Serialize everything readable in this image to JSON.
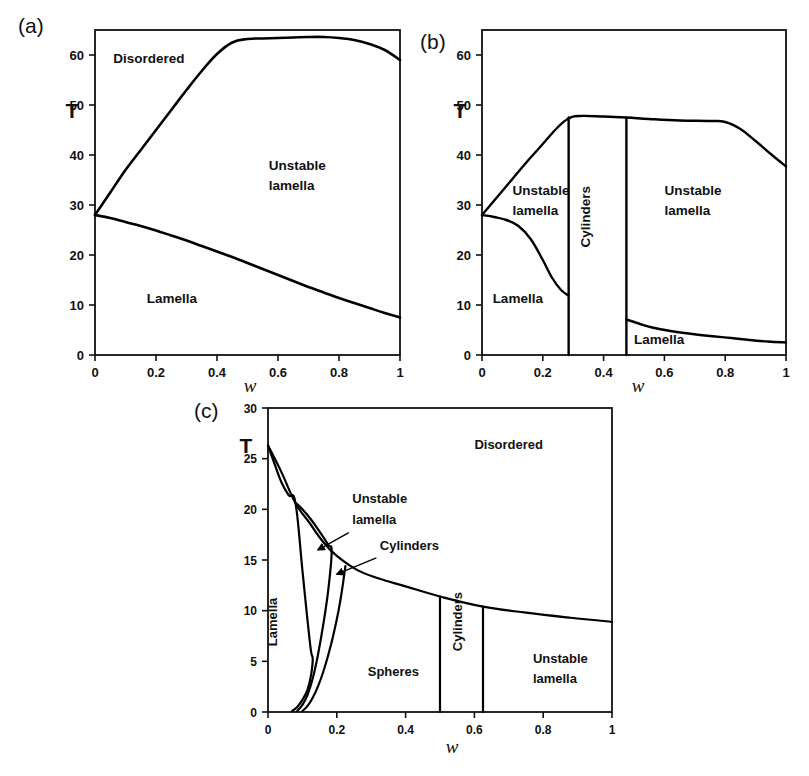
{
  "figure": {
    "panels": [
      {
        "tag": "(a)",
        "axis": {
          "xlabel": "w",
          "ylabel": "T",
          "xticks": [
            "0",
            "0.2",
            "0.4",
            "0.6",
            "0.8",
            "1"
          ],
          "xtick_values": [
            0,
            0.2,
            0.4,
            0.6,
            0.8,
            1
          ],
          "yticks": [
            "0",
            "10",
            "20",
            "30",
            "40",
            "50",
            "60"
          ],
          "ytick_values": [
            0,
            10,
            20,
            30,
            40,
            50,
            60
          ],
          "xlim": [
            0,
            1
          ],
          "ylim": [
            0,
            65
          ]
        },
        "regions": [
          {
            "label": "Disordered",
            "x": 0.06,
            "y": 58.5
          },
          {
            "label": "Unstable",
            "x": 0.57,
            "y": 37.0
          },
          {
            "label": "lamella",
            "x": 0.57,
            "y": 33.0
          },
          {
            "label": "Lamella",
            "x": 0.17,
            "y": 10.5
          }
        ]
      },
      {
        "tag": "(b)",
        "axis": {
          "xlabel": "w",
          "ylabel": "T",
          "xticks": [
            "0",
            "0.2",
            "0.4",
            "0.6",
            "0.8",
            "1"
          ],
          "xtick_values": [
            0,
            0.2,
            0.4,
            0.6,
            0.8,
            1
          ],
          "yticks": [
            "0",
            "10",
            "20",
            "30",
            "40",
            "50",
            "60"
          ],
          "ytick_values": [
            0,
            10,
            20,
            30,
            40,
            50,
            60
          ],
          "xlim": [
            0,
            1
          ],
          "ylim": [
            0,
            65
          ]
        },
        "regions": [
          {
            "label": "Unstable",
            "x": 0.1,
            "y": 32.0
          },
          {
            "label": "lamella",
            "x": 0.1,
            "y": 28.0
          },
          {
            "label": "Cylinders",
            "x": 0.355,
            "y": 21.5,
            "rotate": -90
          },
          {
            "label": "Unstable",
            "x": 0.6,
            "y": 32.0
          },
          {
            "label": "lamella",
            "x": 0.6,
            "y": 28.0
          },
          {
            "label": "Lamella",
            "x": 0.5,
            "y": 2.2
          },
          {
            "label": "Lamella",
            "x": 0.035,
            "y": 10.5
          }
        ]
      },
      {
        "tag": "(c)",
        "axis": {
          "xlabel": "w",
          "ylabel": "T",
          "xticks": [
            "0",
            "0.2",
            "0.4",
            "0.6",
            "0.8",
            "1"
          ],
          "xtick_values": [
            0,
            0.2,
            0.4,
            0.6,
            0.8,
            1
          ],
          "yticks": [
            "0",
            "5",
            "10",
            "15",
            "20",
            "25",
            "30"
          ],
          "ytick_values": [
            0,
            5,
            10,
            15,
            20,
            25,
            30
          ],
          "xlim": [
            0,
            1
          ],
          "ylim": [
            0,
            30
          ]
        },
        "regions": [
          {
            "label": "Disordered",
            "x": 0.6,
            "y": 26.0
          },
          {
            "label": "Unstable",
            "x": 0.245,
            "y": 20.6
          },
          {
            "label": "lamella",
            "x": 0.245,
            "y": 18.6
          },
          {
            "label": "Cylinders",
            "x": 0.325,
            "y": 16.0
          },
          {
            "label": "Lamella",
            "x": 0.025,
            "y": 6.5,
            "rotate": -90
          },
          {
            "label": "Spheres",
            "x": 0.29,
            "y": 3.6
          },
          {
            "label": "Cylinders",
            "x": 0.565,
            "y": 6.0,
            "rotate": -90
          },
          {
            "label": "Unstable",
            "x": 0.77,
            "y": 4.8
          },
          {
            "label": "lamella",
            "x": 0.77,
            "y": 2.9
          }
        ]
      }
    ]
  },
  "chart_data": [
    {
      "type": "line",
      "panel": "(a)",
      "title": "",
      "xlabel": "w",
      "ylabel": "T",
      "xlim": [
        0,
        1
      ],
      "ylim": [
        0,
        65
      ],
      "grid": false,
      "legend": "none",
      "annotations": [
        "Disordered",
        "Unstable lamella",
        "Lamella"
      ],
      "series": [
        {
          "name": "Order-disorder transition (upper boundary)",
          "x": [
            0,
            0.05,
            0.1,
            0.15,
            0.2,
            0.25,
            0.3,
            0.35,
            0.4,
            0.45,
            0.5,
            0.55,
            0.6,
            0.65,
            0.7,
            0.75,
            0.8,
            0.85,
            0.9,
            0.95,
            1.0
          ],
          "y": [
            28.0,
            32.5,
            37.0,
            41.0,
            45.0,
            49.0,
            53.0,
            56.8,
            60.2,
            62.5,
            63.2,
            63.3,
            63.4,
            63.5,
            63.6,
            63.6,
            63.4,
            63.0,
            62.2,
            61.0,
            59.0
          ]
        },
        {
          "name": "Lamella stability limit (lower boundary)",
          "x": [
            0,
            0.05,
            0.1,
            0.15,
            0.2,
            0.25,
            0.3,
            0.35,
            0.4,
            0.45,
            0.5,
            0.55,
            0.6,
            0.65,
            0.7,
            0.75,
            0.8,
            0.85,
            0.9,
            0.95,
            1.0
          ],
          "y": [
            28.0,
            27.4,
            26.6,
            25.8,
            24.9,
            23.9,
            22.9,
            21.8,
            20.7,
            19.6,
            18.4,
            17.2,
            16.0,
            14.8,
            13.6,
            12.5,
            11.4,
            10.4,
            9.4,
            8.4,
            7.5
          ]
        }
      ]
    },
    {
      "type": "line",
      "panel": "(b)",
      "title": "",
      "xlabel": "w",
      "ylabel": "T",
      "xlim": [
        0,
        1
      ],
      "ylim": [
        0,
        65
      ],
      "grid": false,
      "legend": "none",
      "annotations": [
        "Unstable lamella",
        "Cylinders",
        "Unstable lamella",
        "Lamella",
        "Lamella"
      ],
      "series": [
        {
          "name": "Order-disorder transition (upper boundary)",
          "x": [
            0,
            0.05,
            0.1,
            0.15,
            0.2,
            0.25,
            0.285,
            0.32,
            0.4,
            0.475,
            0.55,
            0.65,
            0.75,
            0.8,
            0.85,
            0.9,
            0.95,
            1.0
          ],
          "y": [
            28.0,
            31.6,
            35.2,
            38.8,
            42.2,
            45.6,
            47.3,
            47.8,
            47.7,
            47.5,
            47.2,
            46.9,
            46.8,
            46.6,
            45.2,
            42.8,
            40.2,
            37.7
          ]
        },
        {
          "name": "Left lamella stability limit",
          "x": [
            0,
            0.04,
            0.08,
            0.12,
            0.16,
            0.2,
            0.23,
            0.26,
            0.285
          ],
          "y": [
            28.0,
            27.6,
            27.0,
            25.8,
            23.2,
            19.0,
            15.5,
            13.0,
            11.9
          ]
        },
        {
          "name": "Right lamella stability limit",
          "x": [
            0.475,
            0.52,
            0.56,
            0.62,
            0.68,
            0.75,
            0.82,
            0.88,
            0.94,
            1.0
          ],
          "y": [
            7.1,
            6.2,
            5.5,
            4.8,
            4.3,
            3.8,
            3.4,
            3.0,
            2.7,
            2.5
          ]
        },
        {
          "name": "Lamella/Cylinders vertical boundary",
          "x": [
            0.285,
            0.285
          ],
          "y": [
            0,
            47.5
          ]
        },
        {
          "name": "Cylinders/Unstable-lamella vertical boundary",
          "x": [
            0.475,
            0.475
          ],
          "y": [
            0,
            47.4
          ]
        }
      ]
    },
    {
      "type": "line",
      "panel": "(c)",
      "title": "",
      "xlabel": "w",
      "ylabel": "T",
      "xlim": [
        0,
        1
      ],
      "ylim": [
        0,
        30
      ],
      "grid": false,
      "legend": "none",
      "annotations": [
        "Disordered",
        "Unstable lamella",
        "Cylinders",
        "Lamella",
        "Spheres",
        "Cylinders",
        "Unstable lamella"
      ],
      "series": [
        {
          "name": "Order-disorder transition (upper boundary)",
          "x": [
            0,
            0.04,
            0.08,
            0.12,
            0.16,
            0.2,
            0.26,
            0.32,
            0.4,
            0.5,
            0.625,
            0.75,
            0.88,
            1.0
          ],
          "y": [
            26.3,
            23.6,
            20.6,
            18.7,
            16.8,
            15.4,
            14.0,
            13.2,
            12.4,
            11.4,
            10.4,
            9.8,
            9.3,
            8.9
          ]
        },
        {
          "name": "Lamella boundary (steep descent)",
          "x": [
            0,
            0.02,
            0.04,
            0.06,
            0.08,
            0.1,
            0.115,
            0.125,
            0.13,
            0.125,
            0.115,
            0.1,
            0.085,
            0.07
          ],
          "y": [
            26.3,
            24.4,
            22.6,
            21.4,
            20.6,
            14.0,
            9.0,
            6.0,
            5.2,
            3.6,
            2.2,
            1.2,
            0.5,
            0.1
          ]
        },
        {
          "name": "Unstable-lamella / cylinders boundary",
          "x": [
            0.082,
            0.1,
            0.125,
            0.15,
            0.175,
            0.185,
            0.175,
            0.16,
            0.145,
            0.13,
            0.115,
            0.1,
            0.085
          ],
          "y": [
            20.6,
            20.0,
            19.0,
            17.8,
            16.5,
            15.8,
            12.0,
            8.5,
            5.6,
            3.3,
            1.7,
            0.7,
            0.1
          ]
        },
        {
          "name": "Cylinders / spheres boundary",
          "x": [
            0.225,
            0.215,
            0.205,
            0.19,
            0.175,
            0.16,
            0.145,
            0.13,
            0.115,
            0.1
          ],
          "y": [
            14.4,
            12.0,
            10.0,
            7.6,
            5.6,
            3.9,
            2.5,
            1.4,
            0.6,
            0.1
          ]
        },
        {
          "name": "Spheres/Cylinders vertical boundary",
          "x": [
            0.5,
            0.5
          ],
          "y": [
            0,
            11.4
          ]
        },
        {
          "name": "Cylinders/Unstable-lamella vertical boundary",
          "x": [
            0.625,
            0.625
          ],
          "y": [
            0,
            10.4
          ]
        }
      ]
    }
  ]
}
